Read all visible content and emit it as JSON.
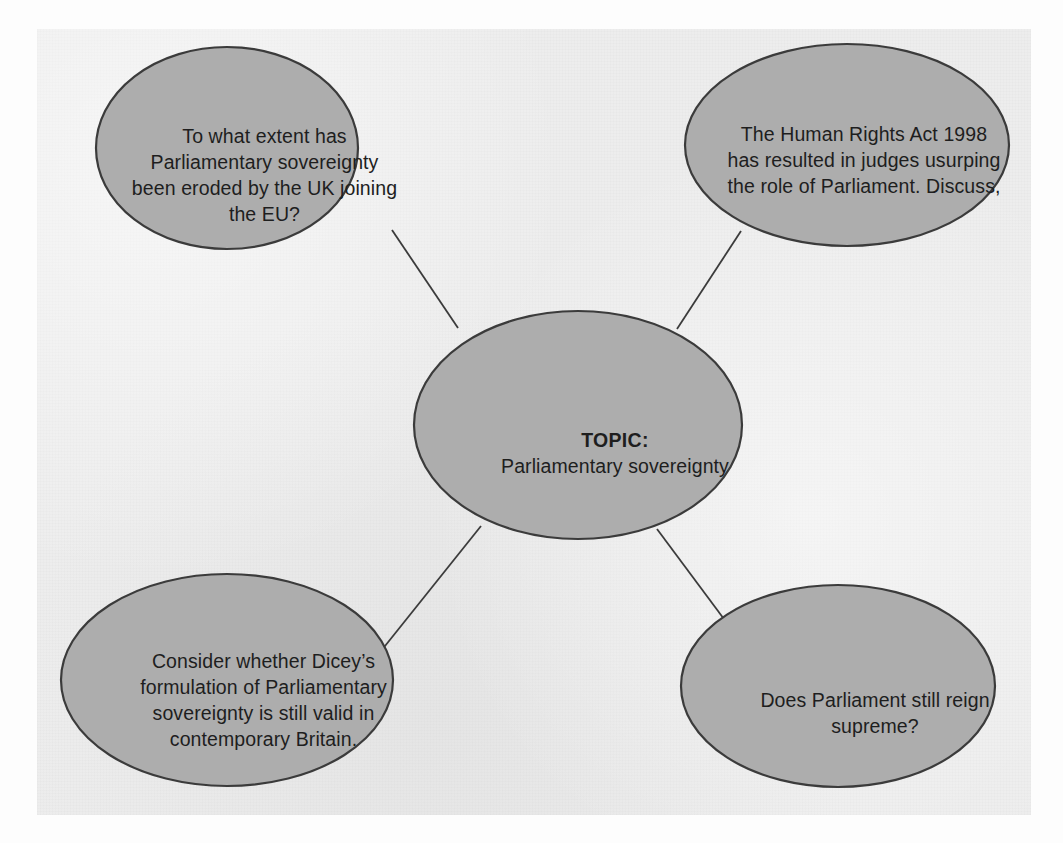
{
  "document": {
    "kind": "mind-map",
    "panel_background": "#ededed",
    "page_background": "#fdfdfd"
  },
  "style": {
    "node_fill": "#adadad",
    "node_stroke": "#3b3b3b",
    "connector_stroke": "#3b3b3b",
    "text_color": "#1e1e1e"
  },
  "center_node": {
    "label": "TOPIC:",
    "topic": "Parliamentary sovereignty"
  },
  "branch_nodes": [
    {
      "id": "top-left",
      "lines": [
        "To what extent has",
        "Parliamentary sovereignty",
        "been eroded by the UK joining",
        "the EU?"
      ],
      "text": "To what extent has Parliamentary sovereignty been eroded by the UK joining the EU?"
    },
    {
      "id": "top-right",
      "lines": [
        "The Human Rights Act 1998",
        "has resulted in judges usurping",
        "the role of Parliament. Discuss,"
      ],
      "text": "The Human Rights Act 1998 has resulted in judges usurping the role of Parliament. Discuss,"
    },
    {
      "id": "bottom-left",
      "lines": [
        "Consider whether Dicey’s",
        "formulation of Parliamentary",
        "sovereignty is still valid in",
        "contemporary Britain."
      ],
      "text": "Consider whether Dicey’s formulation of Parliamentary sovereignty is still valid in contemporary Britain."
    },
    {
      "id": "bottom-right",
      "lines": [
        "Does Parliament still reign",
        "supreme?"
      ],
      "text": "Does Parliament still reign supreme?"
    }
  ]
}
